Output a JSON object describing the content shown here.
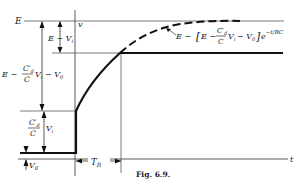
{
  "figure": {
    "caption": "Fig. 6.9.",
    "axes": {
      "y_label": "v",
      "x_label": "t"
    },
    "levels": {
      "top": "E",
      "e_minus_vi": "E − V",
      "e_minus_vi_sub": "i",
      "mid_E": "E −",
      "mid_num": "C′",
      "mid_num_sub": "d",
      "mid_den": "C",
      "mid_vi": "V",
      "mid_vi_sub": "i",
      "mid_rest": "− V",
      "mid_rest_sub": "0",
      "low_num": "C′",
      "low_num_sub": "d",
      "low_den": "C",
      "low_vi": "V",
      "low_vi_sub": "i",
      "v0": "V",
      "v0_sub": "0"
    },
    "curve_label": {
      "p1": "E − ",
      "p2": "E −",
      "num": "C′",
      "num_sub": "d",
      "den": "C",
      "vi": "V",
      "vi_sub": "i",
      "rest": "− V",
      "rest_sub": "0",
      "exp_base": "e",
      "exponent": "−t/RC"
    },
    "tr_label": "T",
    "tr_sub": "R"
  }
}
